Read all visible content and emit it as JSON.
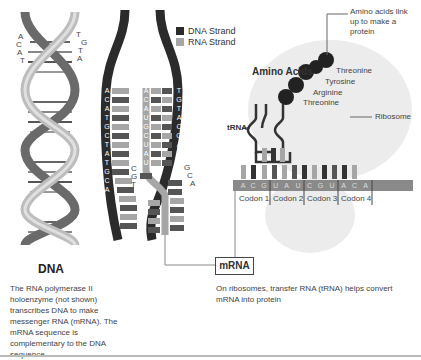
{
  "legend": {
    "items": [
      {
        "label": "DNA Strand",
        "color": "#2b2b2b"
      },
      {
        "label": "RNA Strand",
        "color": "#a6a6a6"
      }
    ]
  },
  "dna_helix": {
    "left_bases": [
      "A",
      "C",
      "A",
      "T"
    ],
    "right_bases": [
      "T",
      "G",
      "T",
      "A"
    ]
  },
  "transcription": {
    "left_dna_strand": [
      "A",
      "C",
      "A",
      "T",
      "G",
      "C",
      "T",
      "A",
      "T",
      "G",
      "C",
      "A"
    ],
    "rna_strand": [
      "A",
      "C",
      "A",
      "U",
      "G",
      "C",
      "U",
      "A",
      "U",
      "G",
      "C",
      "A"
    ],
    "right_dna_strand": [
      "T",
      "G",
      "T",
      "A",
      "C",
      "G",
      "A",
      "T",
      "A"
    ],
    "unpaired_bases_left": [
      "C",
      "G",
      "T"
    ],
    "unpaired_bases_right": [
      "G",
      "C",
      "A"
    ]
  },
  "ribosome": {
    "amino_acids_title": "Amino Acids",
    "amino_acids": [
      "Threonine",
      "Tyrosine",
      "Arginine",
      "Threonine"
    ],
    "amino_note": "Amino acids link up to make a protein",
    "trna_label": "tRNA",
    "ribosome_label": "Ribosome",
    "mrna_bases": [
      "A",
      "C",
      "G",
      "U",
      "A",
      "U",
      "C",
      "G",
      "U",
      "A",
      "C",
      "A"
    ],
    "codons": [
      "Codon 1",
      "Codon 2",
      "Codon 3",
      "Codon 4"
    ]
  },
  "labels": {
    "dna_title": "DNA",
    "dna_caption": "The RNA polymerase II holoenzyme (not shown) transcribes DNA to make messenger RNA (mRNA). The mRNA sequence is complementary to the DNA sequence.",
    "mrna_box": "mRNA",
    "trna_caption": "On ribosomes, transfer RNA (tRNA) helps convert mRNA into protein"
  },
  "colors": {
    "dna_dark": "#2b2b2b",
    "rna_light": "#a6a6a6",
    "mid_gray": "#7a7a7a",
    "ribosome": "#ececec"
  }
}
